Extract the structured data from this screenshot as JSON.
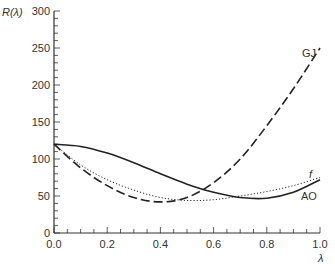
{
  "chart_data": {
    "type": "line",
    "title": "",
    "xlabel": "λ",
    "ylabel": "R(λ)",
    "xlim": [
      0.0,
      1.0
    ],
    "ylim": [
      0,
      300
    ],
    "x_ticks": [
      "0.0",
      "0.2",
      "0.4",
      "0.6",
      "0.8",
      "1.0"
    ],
    "y_ticks": [
      "0",
      "50",
      "100",
      "150",
      "200",
      "250",
      "300"
    ],
    "grid": false,
    "x": [
      0.0,
      0.1,
      0.2,
      0.3,
      0.4,
      0.5,
      0.6,
      0.7,
      0.8,
      0.9,
      1.0
    ],
    "series": [
      {
        "name": "GJ",
        "style": "dashed",
        "values": [
          120,
          88,
          64,
          48,
          42,
          48,
          68,
          100,
          145,
          195,
          250
        ]
      },
      {
        "name": "f",
        "style": "dotted",
        "values": [
          120,
          92,
          72,
          58,
          48,
          44,
          45,
          50,
          56,
          64,
          75
        ]
      },
      {
        "name": "AO",
        "style": "solid",
        "values": [
          120,
          117,
          108,
          95,
          80,
          66,
          55,
          48,
          47,
          55,
          72
        ]
      }
    ]
  }
}
